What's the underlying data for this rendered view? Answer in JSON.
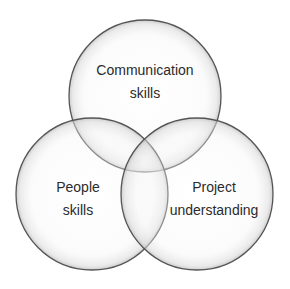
{
  "diagram": {
    "type": "venn",
    "sets": [
      {
        "id": "communication",
        "label_lines": [
          "Communication",
          "skills"
        ]
      },
      {
        "id": "people",
        "label_lines": [
          "People",
          "skills"
        ]
      },
      {
        "id": "project",
        "label_lines": [
          "Project",
          "understanding"
        ]
      }
    ],
    "colors": {
      "stroke": "#555555",
      "fill_center": "#ffffff",
      "fill_edge": "#c8c8c8",
      "text": "#2b2b2b"
    }
  }
}
